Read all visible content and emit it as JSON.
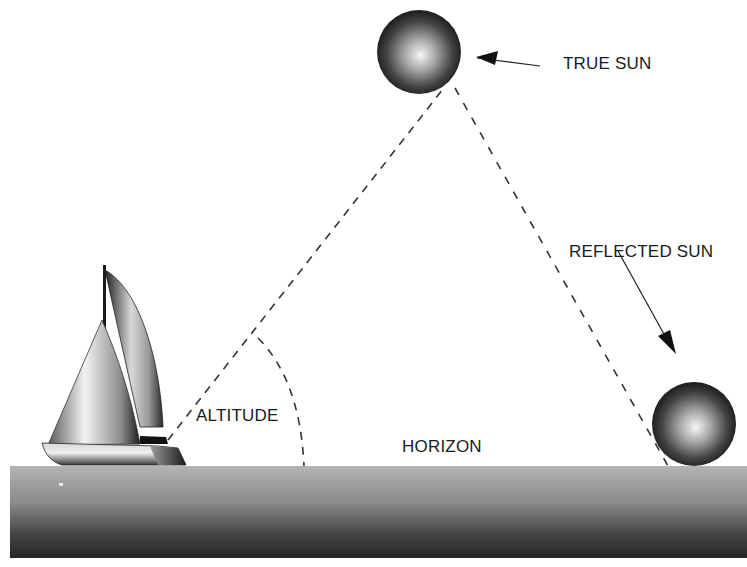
{
  "diagram": {
    "labels": {
      "true_sun": "TRUE SUN",
      "reflected_sun": "REFLECTED SUN",
      "altitude": "ALTITUDE",
      "horizon": "HORIZON"
    },
    "elements": {
      "true_sun": {
        "cx": 419,
        "cy": 52,
        "r": 42
      },
      "reflected_sun": {
        "cx": 694,
        "cy": 424,
        "r": 42
      },
      "horizon_y": 466,
      "observer_point": {
        "x": 168,
        "y": 440
      }
    },
    "colors": {
      "background": "#ffffff",
      "ink": "#1a1a1a",
      "sun_dark": "#1c1c1c",
      "sun_light": "#f4f4f4",
      "sea_top": "#b0b0b0",
      "sea_bottom": "#2a2a2a"
    }
  }
}
